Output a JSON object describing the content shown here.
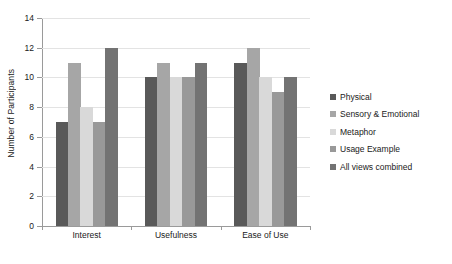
{
  "chart_data": {
    "type": "bar",
    "title": "",
    "subtitle": "",
    "xlabel": "",
    "ylabel": "Number of Participants",
    "categories": [
      "Interest",
      "Usefulness",
      "Ease of Use"
    ],
    "series": [
      {
        "name": "Physical",
        "values": [
          7,
          10,
          11
        ],
        "color": "#595959"
      },
      {
        "name": "Sensory & Emotional",
        "values": [
          11,
          11,
          12
        ],
        "color": "#a6a6a6"
      },
      {
        "name": "Metaphor",
        "values": [
          8,
          10,
          10
        ],
        "color": "#d9d9d9"
      },
      {
        "name": "Usage Example",
        "values": [
          7,
          10,
          9
        ],
        "color": "#999999"
      },
      {
        "name": "All views combined",
        "values": [
          12,
          11,
          10
        ],
        "color": "#737373"
      }
    ],
    "ylim": [
      0,
      14
    ],
    "y_ticks": [
      0,
      2,
      4,
      6,
      8,
      10,
      12,
      14
    ],
    "y_tick_labels": [
      "0",
      "2",
      "4",
      "6",
      "8",
      "10",
      "12",
      "14"
    ],
    "grid": true,
    "legend_position": "right",
    "background_color": "#ffffff",
    "axis_color": "#9a9a9a",
    "grid_color": "#e3e3e3"
  }
}
